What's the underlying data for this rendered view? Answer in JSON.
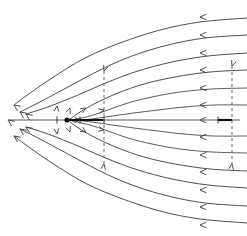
{
  "figure": {
    "width": 247,
    "height": 236,
    "background_color": "#ffffff",
    "stroke_color": "#3a3a3a",
    "axis_color": "#555555",
    "accent_color": "#111111",
    "dashed_color": "#555555"
  },
  "axis": {
    "name": "horizontal-symmetry-axis",
    "y": 120,
    "x_start": 8,
    "x_end": 240,
    "thick_segment": {
      "x_start": 67,
      "x_end": 103,
      "color": "#111111"
    }
  },
  "stagnation_point": {
    "label": "stagnation-point",
    "x": 67,
    "y": 120,
    "radius": 2.6
  },
  "tick_marks": [
    {
      "name": "tick-axis-left",
      "x": 57,
      "y": 120
    },
    {
      "name": "tick-axis-inner",
      "x": 80,
      "y": 120
    },
    {
      "name": "tick-axis-mid",
      "x": 104,
      "y": 120
    },
    {
      "name": "tick-axis-right",
      "x": 218,
      "y": 120
    }
  ],
  "dashed_verticals": [
    {
      "name": "dashed-vertical-mid",
      "x": 104,
      "y_top": 71,
      "y_bottom": 164
    },
    {
      "name": "dashed-vertical-right",
      "x": 232,
      "y_top": 66,
      "y_bottom": 164
    }
  ],
  "chart_data": {
    "type": "line",
    "xlabel": "",
    "ylabel": "",
    "xlim": [
      0,
      247
    ],
    "ylim": [
      236,
      0
    ],
    "grid": false,
    "legend": null,
    "flow_direction": "right-to-left",
    "series": [
      {
        "name": "streamline-outer-top-1",
        "group": "outer-top",
        "arrow_at": "left-end",
        "points": [
          [
            247,
            18
          ],
          [
            200,
            22
          ],
          [
            160,
            30
          ],
          [
            120,
            43
          ],
          [
            85,
            58
          ],
          [
            52,
            78
          ],
          [
            26,
            96
          ],
          [
            14,
            105
          ]
        ]
      },
      {
        "name": "streamline-outer-top-2",
        "group": "outer-top",
        "arrow_at": "left-end",
        "points": [
          [
            247,
            35
          ],
          [
            205,
            38
          ],
          [
            168,
            45
          ],
          [
            132,
            56
          ],
          [
            100,
            70
          ],
          [
            68,
            87
          ],
          [
            38,
            103
          ],
          [
            20,
            112
          ]
        ]
      },
      {
        "name": "streamline-outer-top-3",
        "group": "outer-top",
        "arrow_at": "left-end",
        "points": [
          [
            247,
            53
          ],
          [
            208,
            56
          ],
          [
            172,
            62
          ],
          [
            138,
            71
          ],
          [
            108,
            82
          ],
          [
            78,
            95
          ],
          [
            48,
            107
          ],
          [
            26,
            114
          ]
        ]
      },
      {
        "name": "streamline-dividing-top",
        "group": "dividing",
        "arrow_at": "left-end",
        "points": [
          [
            247,
            70
          ],
          [
            210,
            72
          ],
          [
            175,
            77
          ],
          [
            144,
            84
          ],
          [
            118,
            93
          ],
          [
            96,
            103
          ],
          [
            80,
            112
          ],
          [
            70,
            119
          ]
        ]
      },
      {
        "name": "streamline-inner-top-1",
        "group": "inner-top",
        "arrow_at": "left-end",
        "points": [
          [
            247,
            88
          ],
          [
            212,
            89
          ],
          [
            180,
            92
          ],
          [
            152,
            97
          ],
          [
            128,
            103
          ],
          [
            108,
            110
          ],
          [
            90,
            116
          ],
          [
            72,
            120
          ]
        ]
      },
      {
        "name": "streamline-inner-top-2",
        "group": "inner-top",
        "arrow_at": "left-end",
        "points": [
          [
            247,
            105
          ],
          [
            214,
            105
          ],
          [
            184,
            107
          ],
          [
            158,
            110
          ],
          [
            134,
            113
          ],
          [
            112,
            116
          ],
          [
            92,
            119
          ],
          [
            72,
            120
          ]
        ]
      },
      {
        "name": "streamline-axis",
        "group": "axis",
        "arrow_at": "left-end",
        "points": [
          [
            240,
            120
          ],
          [
            150,
            120
          ],
          [
            103,
            120
          ],
          [
            67,
            120
          ],
          [
            8,
            120
          ]
        ]
      },
      {
        "name": "streamline-inner-bottom-2",
        "group": "inner-bottom",
        "arrow_at": "left-end",
        "points": [
          [
            247,
            136
          ],
          [
            214,
            136
          ],
          [
            184,
            134
          ],
          [
            158,
            131
          ],
          [
            134,
            128
          ],
          [
            112,
            125
          ],
          [
            92,
            122
          ],
          [
            72,
            120
          ]
        ]
      },
      {
        "name": "streamline-inner-bottom-1",
        "group": "inner-bottom",
        "arrow_at": "left-end",
        "points": [
          [
            247,
            153
          ],
          [
            212,
            152
          ],
          [
            180,
            149
          ],
          [
            152,
            144
          ],
          [
            128,
            138
          ],
          [
            108,
            131
          ],
          [
            90,
            125
          ],
          [
            72,
            121
          ]
        ]
      },
      {
        "name": "streamline-dividing-bottom",
        "group": "dividing",
        "arrow_at": "left-end",
        "points": [
          [
            247,
            171
          ],
          [
            210,
            169
          ],
          [
            175,
            164
          ],
          [
            144,
            157
          ],
          [
            118,
            148
          ],
          [
            96,
            138
          ],
          [
            80,
            129
          ],
          [
            70,
            122
          ]
        ]
      },
      {
        "name": "streamline-outer-bottom-3",
        "group": "outer-bottom",
        "arrow_at": "left-end",
        "points": [
          [
            247,
            188
          ],
          [
            208,
            185
          ],
          [
            172,
            179
          ],
          [
            138,
            170
          ],
          [
            108,
            159
          ],
          [
            78,
            146
          ],
          [
            48,
            134
          ],
          [
            26,
            127
          ]
        ]
      },
      {
        "name": "streamline-outer-bottom-2",
        "group": "outer-bottom",
        "arrow_at": "left-end",
        "points": [
          [
            247,
            206
          ],
          [
            205,
            203
          ],
          [
            168,
            196
          ],
          [
            132,
            185
          ],
          [
            100,
            171
          ],
          [
            68,
            154
          ],
          [
            38,
            138
          ],
          [
            20,
            129
          ]
        ]
      },
      {
        "name": "streamline-outer-bottom-1",
        "group": "outer-bottom",
        "arrow_at": "left-end",
        "points": [
          [
            247,
            223
          ],
          [
            200,
            219
          ],
          [
            160,
            211
          ],
          [
            120,
            198
          ],
          [
            85,
            183
          ],
          [
            52,
            163
          ],
          [
            26,
            145
          ],
          [
            14,
            136
          ]
        ]
      }
    ],
    "right_edge_arrowheads_y": [
      17,
      35,
      53,
      70,
      88,
      105,
      120,
      137,
      155,
      172,
      190,
      207,
      225
    ],
    "left_edge_arrowheads": [
      {
        "x": 14,
        "y": 105
      },
      {
        "x": 20,
        "y": 112
      },
      {
        "x": 26,
        "y": 114
      },
      {
        "x": 8,
        "y": 120
      },
      {
        "x": 26,
        "y": 127
      },
      {
        "x": 20,
        "y": 129
      },
      {
        "x": 14,
        "y": 136
      }
    ],
    "interior_arrowheads": [
      {
        "x": 70,
        "y": 108,
        "angle": 110
      },
      {
        "x": 86,
        "y": 108,
        "angle": 150
      },
      {
        "x": 104,
        "y": 110,
        "angle": 168
      },
      {
        "x": 57,
        "y": 106,
        "angle": 95
      },
      {
        "x": 70,
        "y": 132,
        "angle": 250
      },
      {
        "x": 86,
        "y": 132,
        "angle": 210
      },
      {
        "x": 104,
        "y": 130,
        "angle": 192
      },
      {
        "x": 57,
        "y": 134,
        "angle": 265
      },
      {
        "x": 80,
        "y": 120,
        "angle": 180
      }
    ]
  }
}
